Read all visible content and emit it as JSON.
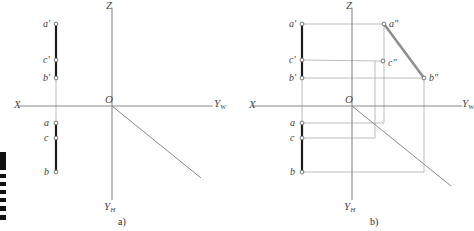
{
  "figure": {
    "caption_a": "a)",
    "caption_b": "b)",
    "colors": {
      "axis": "#8a8a8a",
      "thin_line": "#9b9b9b",
      "thick_segment": "#1a1a1a",
      "gray_segment": "#8f8f8f",
      "label_text": "#3d3d3d",
      "background": "#ffffff",
      "edge_artifact": "#111111"
    },
    "panel_a": {
      "name": "projection-diagram-a",
      "axes": {
        "origin_label": "O",
        "x_label": "X",
        "z_label": "Z",
        "yw_label": "Y",
        "yw_sub": "W",
        "yh_label": "Y",
        "yh_sub": "H",
        "origin": {
          "x": 112,
          "y": 106
        },
        "x_axis": {
          "x1": 18,
          "y1": 106,
          "x2": 112,
          "y2": 106
        },
        "yw_axis": {
          "x1": 112,
          "y1": 106,
          "x2": 213,
          "y2": 106
        },
        "z_axis": {
          "x1": 112,
          "y1": 8,
          "x2": 112,
          "y2": 106
        },
        "yh_axis": {
          "x1": 112,
          "y1": 106,
          "x2": 112,
          "y2": 200
        },
        "bisector": {
          "x1": 112,
          "y1": 106,
          "x2": 201,
          "y2": 178
        }
      },
      "points": [
        {
          "id": "a-prime",
          "label": "a",
          "prime": "'",
          "x": 56,
          "y": 24,
          "label_x": 43,
          "label_y": 19
        },
        {
          "id": "c-prime",
          "label": "c",
          "prime": "'",
          "x": 56,
          "y": 60,
          "label_x": 43,
          "label_y": 55
        },
        {
          "id": "b-prime",
          "label": "b",
          "prime": "'",
          "x": 56,
          "y": 78,
          "label_x": 43,
          "label_y": 73
        },
        {
          "id": "a",
          "label": "a",
          "prime": "",
          "x": 56,
          "y": 123,
          "label_x": 44,
          "label_y": 118
        },
        {
          "id": "c",
          "label": "c",
          "prime": "",
          "x": 56,
          "y": 138,
          "label_x": 44,
          "label_y": 133
        },
        {
          "id": "b",
          "label": "b",
          "prime": "",
          "x": 56,
          "y": 172,
          "label_x": 44,
          "label_y": 167
        }
      ],
      "segments": [
        {
          "id": "front-projection-ab",
          "x1": 56,
          "y1": 24,
          "x2": 56,
          "y2": 78,
          "weight": "thick"
        },
        {
          "id": "top-projection-ab",
          "x1": 56,
          "y1": 123,
          "x2": 56,
          "y2": 172,
          "weight": "thick"
        }
      ],
      "connector": {
        "x1": 56,
        "y1": 78,
        "x2": 56,
        "y2": 123
      }
    },
    "panel_b": {
      "name": "projection-diagram-b",
      "axes": {
        "origin_label": "O",
        "x_label": "X",
        "z_label": "Z",
        "yw_label": "Y",
        "yw_sub": "W",
        "yh_label": "Y",
        "yh_sub": "H",
        "origin": {
          "x": 352,
          "y": 106
        },
        "x_axis": {
          "x1": 252,
          "y1": 106,
          "x2": 352,
          "y2": 106
        },
        "yw_axis": {
          "x1": 352,
          "y1": 106,
          "x2": 462,
          "y2": 106
        },
        "z_axis": {
          "x1": 352,
          "y1": 8,
          "x2": 352,
          "y2": 106
        },
        "yh_axis": {
          "x1": 352,
          "y1": 106,
          "x2": 352,
          "y2": 200
        },
        "bisector": {
          "x1": 352,
          "y1": 106,
          "x2": 451,
          "y2": 186
        }
      },
      "points": [
        {
          "id": "a-prime",
          "label": "a",
          "prime": "'",
          "x": 302,
          "y": 24,
          "label_x": 289,
          "label_y": 19
        },
        {
          "id": "c-prime",
          "label": "c",
          "prime": "'",
          "x": 302,
          "y": 60,
          "label_x": 289,
          "label_y": 55
        },
        {
          "id": "b-prime",
          "label": "b",
          "prime": "'",
          "x": 302,
          "y": 78,
          "label_x": 289,
          "label_y": 73
        },
        {
          "id": "a",
          "label": "a",
          "prime": "",
          "x": 302,
          "y": 123,
          "label_x": 290,
          "label_y": 118
        },
        {
          "id": "c",
          "label": "c",
          "prime": "",
          "x": 302,
          "y": 138,
          "label_x": 290,
          "label_y": 133
        },
        {
          "id": "b",
          "label": "b",
          "prime": "",
          "x": 302,
          "y": 172,
          "label_x": 290,
          "label_y": 167
        },
        {
          "id": "a-double-prime",
          "label": "a",
          "prime": "\"",
          "x": 384,
          "y": 24,
          "label_x": 389,
          "label_y": 19
        },
        {
          "id": "c-double-prime",
          "label": "c",
          "prime": "\"",
          "x": 383,
          "y": 61,
          "label_x": 388,
          "label_y": 58
        },
        {
          "id": "b-double-prime",
          "label": "b",
          "prime": "\"",
          "x": 424,
          "y": 78,
          "label_x": 429,
          "label_y": 73
        }
      ],
      "segments": [
        {
          "id": "front-projection-ab",
          "x1": 302,
          "y1": 24,
          "x2": 302,
          "y2": 78,
          "weight": "thick"
        },
        {
          "id": "top-projection-ab",
          "x1": 302,
          "y1": 123,
          "x2": 302,
          "y2": 172,
          "weight": "thick"
        },
        {
          "id": "side-projection-ab",
          "x1": 384,
          "y1": 24,
          "x2": 424,
          "y2": 78,
          "weight": "gray"
        }
      ],
      "connector": {
        "x1": 302,
        "y1": 78,
        "x2": 302,
        "y2": 123
      },
      "projection_lines": [
        {
          "id": "a-prime-to-a-double",
          "x1": 302,
          "y1": 24,
          "x2": 384,
          "y2": 24
        },
        {
          "id": "c-prime-to-c-double",
          "x1": 302,
          "y1": 60,
          "x2": 383,
          "y2": 61
        },
        {
          "id": "b-prime-to-b-double",
          "x1": 302,
          "y1": 78,
          "x2": 424,
          "y2": 78
        },
        {
          "id": "a-to-bisector",
          "x1": 302,
          "y1": 123,
          "x2": 384,
          "y2": 123
        },
        {
          "id": "c-to-bisector",
          "x1": 302,
          "y1": 138,
          "x2": 375,
          "y2": 138
        },
        {
          "id": "b-to-bisector",
          "x1": 302,
          "y1": 172,
          "x2": 424,
          "y2": 172
        },
        {
          "id": "a-double-vertical",
          "x1": 384,
          "y1": 24,
          "x2": 384,
          "y2": 123
        },
        {
          "id": "c-double-vertical",
          "x1": 375,
          "y1": 61,
          "x2": 375,
          "y2": 138
        },
        {
          "id": "b-double-vertical",
          "x1": 424,
          "y1": 78,
          "x2": 424,
          "y2": 172
        }
      ]
    },
    "edge_artifacts": [
      {
        "id": "scan-mark-1",
        "top": 152,
        "height": 18
      },
      {
        "id": "scan-mark-2",
        "top": 174,
        "height": 4
      },
      {
        "id": "scan-mark-3",
        "top": 182,
        "height": 4
      },
      {
        "id": "scan-mark-4",
        "top": 190,
        "height": 4
      },
      {
        "id": "scan-mark-5",
        "top": 198,
        "height": 4
      },
      {
        "id": "scan-mark-6",
        "top": 206,
        "height": 5
      },
      {
        "id": "scan-mark-7",
        "top": 215,
        "height": 5
      }
    ]
  }
}
